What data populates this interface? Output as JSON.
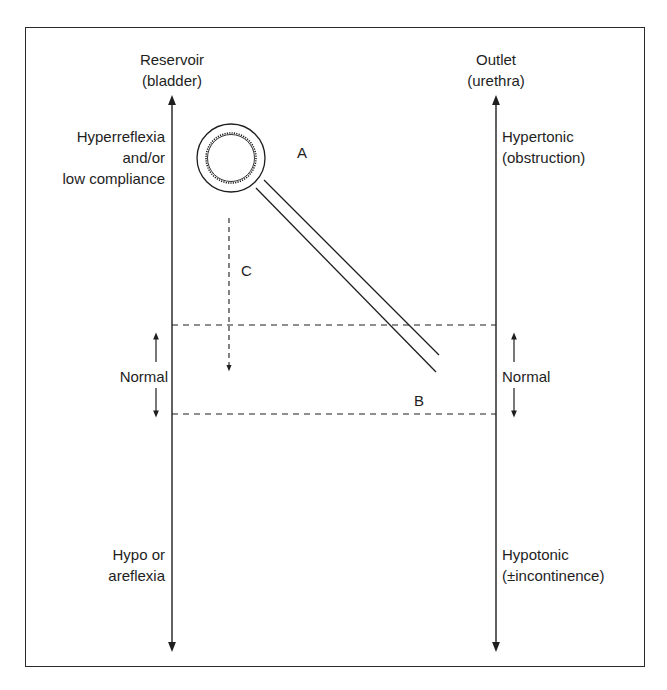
{
  "diagram": {
    "left_axis": {
      "title_line1": "Reservoir",
      "title_line2": "(bladder)",
      "top_label_line1": "Hyperreflexia",
      "top_label_line2": "and/or",
      "top_label_line3": "low compliance",
      "middle_label": "Normal",
      "bottom_label_line1": "Hypo or",
      "bottom_label_line2": "areflexia"
    },
    "right_axis": {
      "title_line1": "Outlet",
      "title_line2": "(urethra)",
      "top_label_line1": "Hypertonic",
      "top_label_line2": "(obstruction)",
      "middle_label": "Normal",
      "bottom_label_line1": "Hypotonic",
      "bottom_label_line2": "(±incontinence)"
    },
    "markers": {
      "a": "A",
      "b": "B",
      "c": "C"
    },
    "colors": {
      "line": "#1e1e1e",
      "background": "#ffffff"
    }
  }
}
